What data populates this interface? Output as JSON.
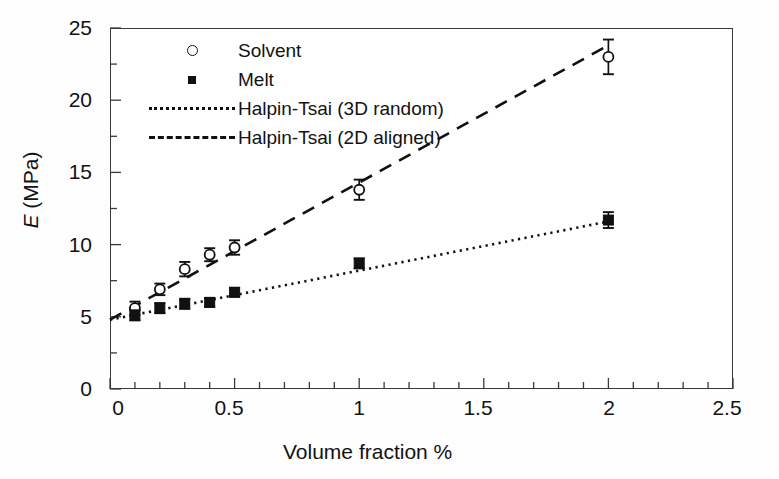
{
  "figure": {
    "background": "#ffffff",
    "frame_color": "#3a3a3a",
    "ink_color": "#111111"
  },
  "axes": {
    "x_title": "Volume fraction %",
    "y_title_symbol": "E",
    "y_title_unit": " (MPa)",
    "x_ticks": [
      "0",
      "0.5",
      "1",
      "1.5",
      "2",
      "2.5"
    ],
    "y_ticks": [
      "0",
      "5",
      "10",
      "15",
      "20",
      "25"
    ],
    "xlim": [
      0,
      2.5
    ],
    "ylim": [
      0,
      25
    ],
    "x_minor_step": 0.1,
    "y_minor_step": 2.5
  },
  "legend": {
    "position": "top-left-inside",
    "entries": [
      {
        "label": "Solvent",
        "key": "open-circle-marker"
      },
      {
        "label": "Melt",
        "key": "filled-square-marker"
      },
      {
        "label": "Halpin-Tsai (3D random)",
        "key": "dotted-line"
      },
      {
        "label": "Halpin-Tsai (2D aligned)",
        "key": "dashed-line"
      }
    ]
  },
  "chart_data": {
    "type": "scatter",
    "title": "",
    "xlabel": "Volume fraction %",
    "ylabel": "E (MPa)",
    "xlim": [
      0,
      2.5
    ],
    "ylim": [
      0,
      25
    ],
    "grid": false,
    "legend_position": "upper left",
    "series": [
      {
        "name": "Solvent",
        "marker": "open-circle",
        "x": [
          0.1,
          0.2,
          0.3,
          0.4,
          0.5,
          1.0,
          2.0
        ],
        "y": [
          5.6,
          6.9,
          8.3,
          9.3,
          9.8,
          13.8,
          23.0
        ],
        "yerr": [
          0.45,
          0.4,
          0.5,
          0.45,
          0.5,
          0.7,
          1.2
        ]
      },
      {
        "name": "Melt",
        "marker": "filled-square",
        "x": [
          0.1,
          0.2,
          0.3,
          0.4,
          0.5,
          1.0,
          2.0
        ],
        "y": [
          5.1,
          5.6,
          5.9,
          6.0,
          6.7,
          8.7,
          11.7
        ],
        "yerr": [
          0.35,
          0.35,
          0.35,
          0.3,
          0.3,
          0.35,
          0.55
        ]
      },
      {
        "name": "Halpin-Tsai (3D random)",
        "style": "dotted-line",
        "x": [
          0.0,
          2.0
        ],
        "y": [
          4.8,
          11.6
        ]
      },
      {
        "name": "Halpin-Tsai (2D aligned)",
        "style": "dashed-line",
        "x": [
          0.0,
          2.0
        ],
        "y": [
          4.8,
          23.8
        ]
      }
    ]
  }
}
